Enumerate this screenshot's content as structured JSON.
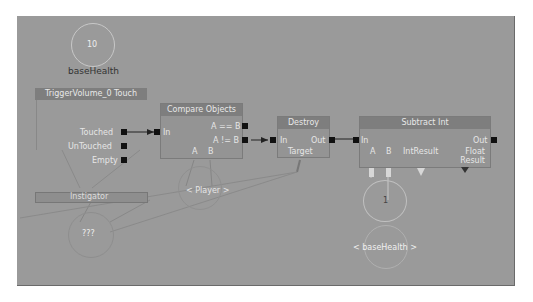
{
  "canvas": {
    "background": "#9a9a9a"
  },
  "nodes": {
    "base_health_var": {
      "value": "10",
      "label": "baseHealth"
    },
    "trigger_touch": {
      "title": "TriggerVolume_0 Touch",
      "outputs": [
        "Touched",
        "UnTouched",
        "Empty"
      ],
      "variable_link": "Instigator"
    },
    "compare_objects": {
      "title": "Compare Objects",
      "input": "In",
      "outputs": [
        "A == B",
        "A != B"
      ],
      "variable_links": [
        "A",
        "B"
      ]
    },
    "destroy": {
      "title": "Destroy",
      "input": "In",
      "output": "Out",
      "variable_link": "Target"
    },
    "subtract_int": {
      "title": "Subtract Int",
      "input": "In",
      "output": "Out",
      "variable_links": [
        "A",
        "B",
        "IntResult",
        "Float Result"
      ]
    },
    "player_var": {
      "label": "< Player >"
    },
    "unknown_var": {
      "label": "???"
    },
    "int_one_var": {
      "value": "1"
    },
    "base_health_ref": {
      "label": "< baseHealth >"
    }
  }
}
